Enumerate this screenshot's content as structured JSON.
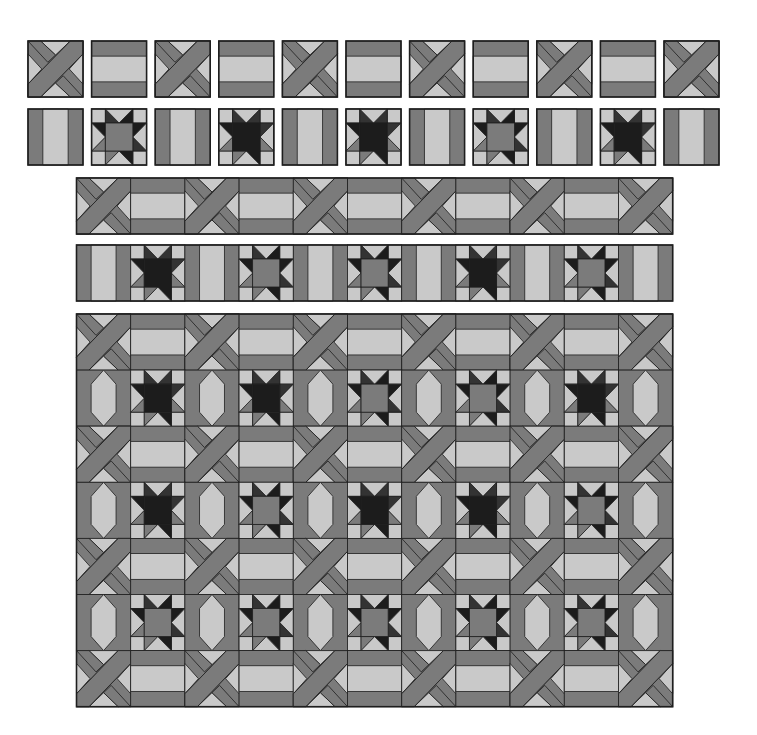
{
  "colors": {
    "light": "#c9c9c9",
    "medium": "#7b7b7b",
    "dark": "#333333",
    "darkest": "#1c1c1c",
    "outline": "#1e1e1e",
    "background": "#ffffff"
  },
  "blocks": {
    "X": "crossed-bands block",
    "H": "horizontal-bar block",
    "V": "vertical-bar block",
    "S": "sawtooth star block"
  },
  "row1": {
    "label": "Row 1 separate blocks",
    "pattern": [
      "X",
      "H",
      "X",
      "H",
      "X",
      "H",
      "X",
      "H",
      "X",
      "H",
      "X"
    ]
  },
  "row2": {
    "label": "Row 2 separate blocks",
    "pattern": [
      "V",
      "S",
      "V",
      "S",
      "V",
      "S",
      "V",
      "S",
      "V",
      "S",
      "V"
    ],
    "star_centers": [
      "medium",
      "dark",
      "dark",
      "medium",
      "dark"
    ]
  },
  "row3": {
    "label": "Joined sashing row",
    "pattern": [
      "X",
      "H",
      "X",
      "H",
      "X",
      "H",
      "X",
      "H",
      "X",
      "H",
      "X"
    ]
  },
  "row4": {
    "label": "Joined star row",
    "pattern": [
      "V",
      "S",
      "V",
      "S",
      "V",
      "S",
      "V",
      "S",
      "V",
      "S",
      "V"
    ],
    "star_centers": [
      "dark",
      "medium",
      "medium",
      "dark",
      "medium"
    ]
  },
  "quilt": {
    "label": "Assembled quilt top",
    "rows": 7,
    "cols": 11,
    "star_centers": [
      [
        "dark",
        "dark",
        "medium",
        "medium",
        "dark"
      ],
      [
        "dark",
        "medium",
        "dark",
        "dark",
        "medium"
      ],
      [
        "medium",
        "medium",
        "medium",
        "medium",
        "medium"
      ]
    ]
  }
}
